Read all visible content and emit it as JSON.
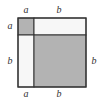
{
  "diagram": {
    "colors": {
      "gray": "#b3b3b3",
      "white": "#f7f7f7",
      "stroke": "#333333"
    },
    "labels": {
      "top_a": "a",
      "top_b": "b",
      "left_a": "a",
      "left_b": "b",
      "right_b": "b",
      "bottom_a": "a",
      "bottom_b": "b"
    },
    "regions": [
      {
        "name": "a-squared",
        "fill": "gray"
      },
      {
        "name": "ab-top",
        "fill": "white"
      },
      {
        "name": "ab-left",
        "fill": "white"
      },
      {
        "name": "b-squared",
        "fill": "gray"
      }
    ]
  }
}
